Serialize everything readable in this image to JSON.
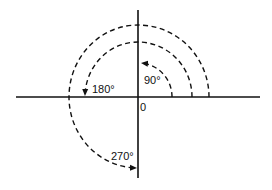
{
  "diagram": {
    "type": "angle-rotation",
    "origin_label": "0",
    "angles": [
      {
        "label": "90°",
        "degrees": 90
      },
      {
        "label": "180°",
        "degrees": 180
      },
      {
        "label": "270°",
        "degrees": 270
      }
    ],
    "colors": {
      "ink": "#111111",
      "background": "#ffffff"
    }
  }
}
